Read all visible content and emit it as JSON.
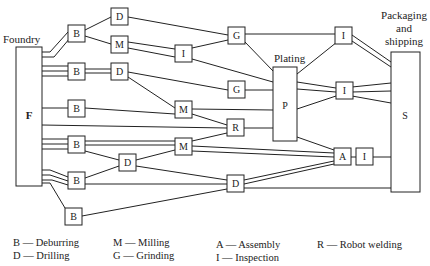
{
  "labels": {
    "foundry": "Foundry",
    "plating": "Plating",
    "packaging_line1": "Packaging",
    "packaging_line2": "and",
    "packaging_line3": "shipping"
  },
  "nodes": {
    "F": "F",
    "S": "S",
    "P": "P",
    "B1": "B",
    "B2": "B",
    "B3": "B",
    "B4": "B",
    "B5": "B",
    "B6": "B",
    "D1": "D",
    "D2": "D",
    "D3": "D",
    "D4": "D",
    "M1": "M",
    "M2": "M",
    "M3": "M",
    "G1": "G",
    "G2": "G",
    "I1": "I",
    "I2": "I",
    "I3": "I",
    "I4": "I",
    "R1": "R",
    "A1": "A"
  },
  "legend": [
    {
      "code": "B",
      "meaning": "Deburring",
      "text": "B — Deburring"
    },
    {
      "code": "D",
      "meaning": "Drilling",
      "text": "D — Drilling"
    },
    {
      "code": "M",
      "meaning": "Milling",
      "text": "M — Milling"
    },
    {
      "code": "G",
      "meaning": "Grinding",
      "text": "G — Grinding"
    },
    {
      "code": "A",
      "meaning": "Assembly",
      "text": "A — Assembly"
    },
    {
      "code": "I",
      "meaning": "Inspection",
      "text": "I — Inspection"
    },
    {
      "code": "R",
      "meaning": "Robot welding",
      "text": "R — Robot welding"
    }
  ]
}
